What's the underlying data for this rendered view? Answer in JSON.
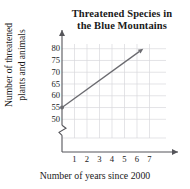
{
  "chart_data": {
    "type": "line",
    "title": "Threatened Species in the Blue Mountains",
    "title_lines": [
      "Threatened Species in",
      "the Blue Mountains"
    ],
    "xlabel": "Number of years since 2000",
    "ylabel": "Number of threatened plants and animals",
    "ylabel_lines": [
      "Number of threatened",
      "plants and animals"
    ],
    "xticks": [
      1,
      2,
      3,
      4,
      5,
      6,
      7
    ],
    "xtick_labels": [
      "1",
      "2",
      "3",
      "4",
      "5",
      "6",
      "7"
    ],
    "yticks": [
      50,
      55,
      60,
      65,
      70,
      75,
      80
    ],
    "ytick_labels": [
      "50",
      "55",
      "60",
      "65",
      "70",
      "75",
      "80"
    ],
    "xlim": [
      0,
      8
    ],
    "ylim": [
      48,
      82
    ],
    "y_axis_break": true,
    "y_axis_break_label": "axis-break-zigzag",
    "grid": true,
    "grid_color": "#d8d8dc",
    "legend": false,
    "series": [
      {
        "name": "Threatened species trend",
        "color": "#6b6b70",
        "marker_at_start": true,
        "arrow_at_end": true,
        "x": [
          0,
          6.5
        ],
        "y": [
          55,
          80
        ],
        "points": [
          {
            "x": 0,
            "y": 55
          },
          {
            "x": 1,
            "y": 58.8
          },
          {
            "x": 2,
            "y": 62.7
          },
          {
            "x": 3,
            "y": 66.5
          },
          {
            "x": 4,
            "y": 70.4
          },
          {
            "x": 5,
            "y": 74.2
          },
          {
            "x": 6,
            "y": 78.1
          },
          {
            "x": 6.5,
            "y": 80
          }
        ],
        "slope_per_year": 3.85,
        "y_intercept": 55
      }
    ],
    "axis_color": "#55555a",
    "text_color": "#1a1a1a"
  }
}
